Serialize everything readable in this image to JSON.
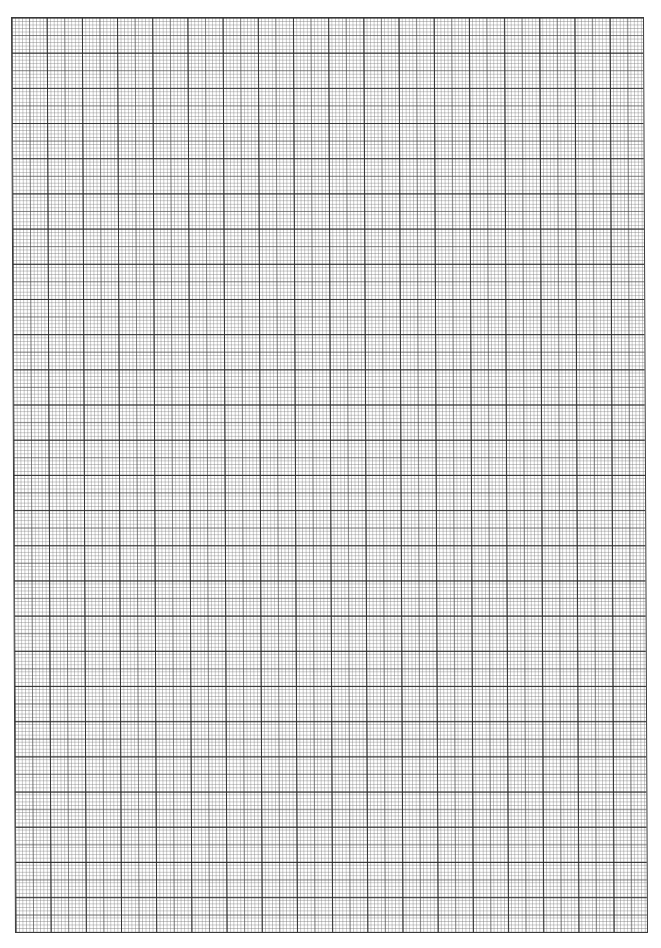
{
  "page": {
    "type": "graph-paper",
    "background_color": "#ffffff",
    "grid": {
      "major_columns": 18,
      "major_rows": 26,
      "minor_divisions_per_major": 10,
      "mid_line_every_minor": 5,
      "major_spacing_px": 35.2,
      "minor_spacing_px": 3.52,
      "major_line_color": "#3a3a3a",
      "minor_line_color": "#aaaaaa",
      "border_color": "#3a3a3a"
    }
  }
}
